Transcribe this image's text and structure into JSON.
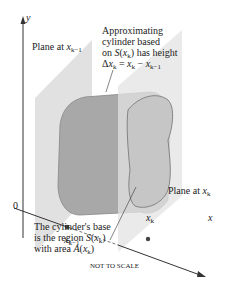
{
  "figure": {
    "axes": {
      "y_label": "y",
      "x_label": "x",
      "origin_label": "0"
    },
    "labels": {
      "plane_left": "Plane at x_{k-1}",
      "plane_right": "Plane at x_k",
      "cylinder_note": [
        "Approximating",
        "cylinder based",
        "on S(x_k) has height",
        "Δx_k = x_k − x_{k−1}"
      ],
      "base_note": [
        "The cylinder's base",
        "is the region S(x_k)",
        "with area A(x_k)"
      ],
      "point_left": "x_{k−1}",
      "point_right": "x_k",
      "footer": "NOT TO SCALE"
    },
    "colors": {
      "plane": "#d8d8d8",
      "cylinder": "#a9a9a9",
      "base_face": "#c4c4c4",
      "outline": "#7a7a7a",
      "axis": "#333333"
    }
  }
}
